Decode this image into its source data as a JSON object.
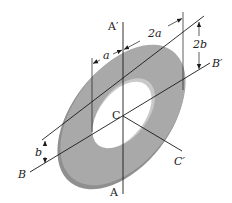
{
  "figure": {
    "colors": {
      "disk_face": "#a9a9a9",
      "disk_edge": "#8c8c8c",
      "hole_rim": "#c8c8c8",
      "lines": "#1a1a1a"
    }
  },
  "labels": {
    "axis_a_top": "A′",
    "axis_a_bottom": "A",
    "axis_b_left": "B",
    "axis_b_right": "B′",
    "centroid": "C",
    "axis_c_end": "C′",
    "dim_a": "a",
    "dim_2a": "2a",
    "dim_2b": "2b",
    "dim_b": "b"
  }
}
